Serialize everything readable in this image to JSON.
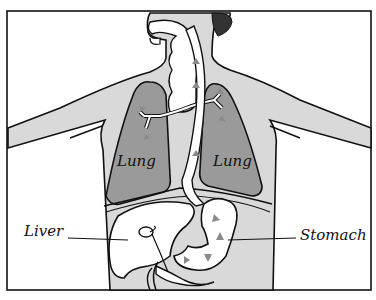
{
  "diagram": {
    "labels": {
      "lung_left": "Lung",
      "lung_right": "Lung",
      "liver": "Liver",
      "stomach": "Stomach"
    },
    "colors": {
      "body_fill": "#d9d9d9",
      "lung_fill": "#9a9a9a",
      "organ_fill": "#ffffff",
      "outline": "#111111",
      "arrow": "#8a8a8a",
      "background": "#ffffff"
    }
  }
}
